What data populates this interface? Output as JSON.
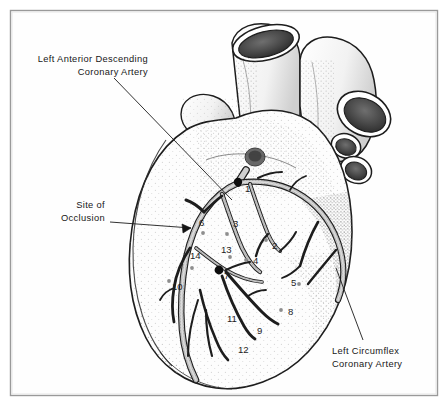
{
  "figure": {
    "background_color": "#ffffff",
    "frame": {
      "border_color": "#9a9a9a",
      "fill_color": "#fefefe",
      "x": 10,
      "y": 10,
      "width": 428,
      "height": 386
    },
    "ink_color": "#1b1b1b",
    "vessel_fill": "#b9b9b9",
    "stipple_color": "#7d7d7d",
    "occlusion_marker_color": "#0d0d0d",
    "minor_marker_color": "#8e8e8e"
  },
  "callouts": [
    {
      "id": "lad",
      "name": "left-anterior-descending",
      "line1": "Left Anterior Descending",
      "line2": "Coronary Artery",
      "text_x": 148,
      "text_y": 62,
      "text_anchor": "end",
      "leader": {
        "x1": 114,
        "y1": 78,
        "x2": 232,
        "y2": 200
      }
    },
    {
      "id": "occlusion",
      "name": "site-of-occlusion",
      "line1": "Site of",
      "line2": "Occlusion",
      "text_x": 105,
      "text_y": 208,
      "text_anchor": "end",
      "leader": {
        "x1": 110,
        "y1": 222,
        "x2": 191,
        "y2": 228
      }
    },
    {
      "id": "circumflex",
      "name": "left-circumflex",
      "line1": "Left Circumflex",
      "line2": "Coronary Artery",
      "text_x": 332,
      "text_y": 354,
      "text_anchor": "start",
      "leader": {
        "x1": 363,
        "y1": 340,
        "x2": 336,
        "y2": 268
      }
    }
  ],
  "markers": [
    {
      "label": "1",
      "label_x": 245,
      "label_y": 192,
      "dot_x": 238,
      "dot_y": 182,
      "dot_r": 4.2,
      "kind": "major"
    },
    {
      "label": "2",
      "label_x": 272,
      "label_y": 249,
      "dot_x": 266,
      "dot_y": 240,
      "dot_r": 1.9,
      "kind": "minor"
    },
    {
      "label": "3",
      "label_x": 233,
      "label_y": 227,
      "dot_x": 227,
      "dot_y": 234,
      "dot_r": 1.9,
      "kind": "minor"
    },
    {
      "label": "4",
      "label_x": 253,
      "label_y": 264,
      "dot_x": 246,
      "dot_y": 260,
      "dot_r": 1.9,
      "kind": "minor"
    },
    {
      "label": "5",
      "label_x": 291,
      "label_y": 286,
      "dot_x": 299,
      "dot_y": 284,
      "dot_r": 1.9,
      "kind": "minor"
    },
    {
      "label": "6",
      "label_x": 199,
      "label_y": 226,
      "dot_x": 203,
      "dot_y": 233,
      "dot_r": 1.9,
      "kind": "minor"
    },
    {
      "label": "7",
      "label_x": 224,
      "label_y": 279,
      "dot_x": 219,
      "dot_y": 270,
      "dot_r": 4.4,
      "kind": "major"
    },
    {
      "label": "8",
      "label_x": 288,
      "label_y": 315,
      "dot_x": 281,
      "dot_y": 310,
      "dot_r": 1.9,
      "kind": "minor"
    },
    {
      "label": "9",
      "label_x": 257,
      "label_y": 334,
      "dot_x": 250,
      "dot_y": 329,
      "dot_r": 0,
      "kind": "plain"
    },
    {
      "label": "10",
      "label_x": 172,
      "label_y": 290,
      "dot_x": 169,
      "dot_y": 281,
      "dot_r": 1.9,
      "kind": "minor"
    },
    {
      "label": "11",
      "label_x": 227,
      "label_y": 322,
      "dot_x": 221,
      "dot_y": 317,
      "dot_r": 0,
      "kind": "plain"
    },
    {
      "label": "12",
      "label_x": 238,
      "label_y": 353,
      "dot_x": 231,
      "dot_y": 349,
      "dot_r": 0,
      "kind": "plain"
    },
    {
      "label": "13",
      "label_x": 221,
      "label_y": 253,
      "dot_x": 230,
      "dot_y": 257,
      "dot_r": 1.9,
      "kind": "minor"
    },
    {
      "label": "14",
      "label_x": 190,
      "label_y": 259,
      "dot_x": 192,
      "dot_y": 268,
      "dot_r": 1.9,
      "kind": "minor"
    }
  ]
}
